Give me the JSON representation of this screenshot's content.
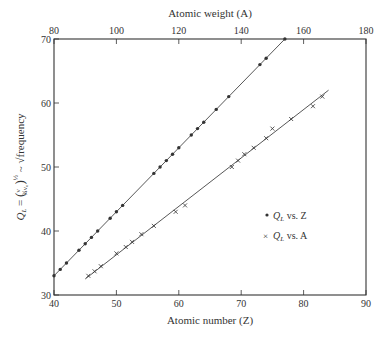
{
  "chart_data": {
    "type": "scatter",
    "title": "",
    "xlabel": "Atomic number (Z)",
    "x2label": "Atomic weight (A)",
    "ylabel": "Q_L = (ν / (3/4)ν₀)^½ ~ √frequency",
    "xlim": [
      40,
      90
    ],
    "x2lim": [
      80,
      180
    ],
    "ylim": [
      30,
      70
    ],
    "x_ticks": [
      40,
      50,
      60,
      70,
      80,
      90
    ],
    "x2_ticks": [
      80,
      100,
      120,
      140,
      160,
      180
    ],
    "y_ticks": [
      30,
      40,
      50,
      60,
      70
    ],
    "grid": false,
    "legend_position": "right-middle",
    "series": [
      {
        "name": "Q_L vs. Z",
        "marker": "dot",
        "axis": "bottom",
        "points": [
          [
            40,
            33
          ],
          [
            41,
            34
          ],
          [
            42,
            35
          ],
          [
            44,
            37
          ],
          [
            45,
            38
          ],
          [
            46,
            39
          ],
          [
            47,
            40
          ],
          [
            49,
            42
          ],
          [
            50,
            43
          ],
          [
            51,
            44
          ],
          [
            56,
            49
          ],
          [
            57,
            50
          ],
          [
            58,
            51
          ],
          [
            59,
            52
          ],
          [
            60,
            53
          ],
          [
            62,
            55
          ],
          [
            63,
            56
          ],
          [
            64,
            57
          ],
          [
            66,
            59
          ],
          [
            68,
            61
          ],
          [
            73,
            66
          ],
          [
            74,
            67
          ],
          [
            77,
            70
          ]
        ],
        "fit_line": [
          [
            40,
            33
          ],
          [
            77,
            70
          ]
        ]
      },
      {
        "name": "Q_L vs. A",
        "marker": "x",
        "axis": "top",
        "points_in_bottom_axis_units": [
          [
            45.5,
            33
          ],
          [
            46.5,
            33.7
          ],
          [
            47.5,
            34.5
          ],
          [
            50,
            36.5
          ],
          [
            51.5,
            37.5
          ],
          [
            52.5,
            38.3
          ],
          [
            54,
            39.5
          ],
          [
            56,
            40.8
          ],
          [
            59.5,
            43
          ],
          [
            61,
            44
          ],
          [
            68.5,
            50
          ],
          [
            69.5,
            51
          ],
          [
            70.5,
            52
          ],
          [
            72,
            53
          ],
          [
            74,
            54.5
          ],
          [
            75,
            56
          ],
          [
            78,
            57.5
          ],
          [
            81.5,
            59.5
          ],
          [
            83,
            61
          ]
        ],
        "fit_line": [
          [
            45,
            32.5
          ],
          [
            84,
            62
          ]
        ]
      }
    ],
    "legend": [
      "• Q_L vs. Z",
      "× Q_L vs. A"
    ]
  },
  "labels": {
    "top_axis_title": "Atomic weight (A)",
    "bottom_axis_title": "Atomic number (Z)",
    "legend_z": "Q",
    "legend_z_sub": "L",
    "legend_z_rest": " vs. Z",
    "legend_a": "Q",
    "legend_a_sub": "L",
    "legend_a_rest": " vs. A",
    "y_title_q": "Q",
    "y_title_sub": "L",
    "y_title_eq": " = ",
    "y_title_nu": "ν",
    "y_title_den": "¾ν₀",
    "y_title_exp": "½",
    "y_title_tail": "  ~ √frequency"
  },
  "colors": {
    "ink": "#333333",
    "line": "#444444",
    "background": "#ffffff"
  }
}
